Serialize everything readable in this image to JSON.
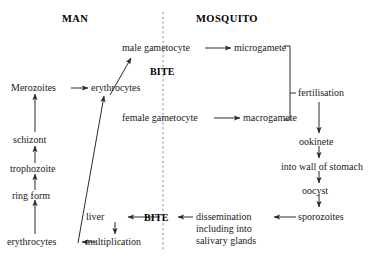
{
  "diagram": {
    "title_left": "MAN",
    "title_right": "MOSQUITO",
    "divider": "dashed-vertical-line",
    "bite_upper": "BITE",
    "bite_lower": "BITE",
    "colors": {
      "background": "#ffffff",
      "text": "#1a1a1a",
      "stroke": "#333333"
    },
    "nodes": {
      "merozoites": "Merozoites",
      "erythrocytes_upper": "erythrocytes",
      "schizont": "schizont",
      "trophozoite": "trophozoite",
      "ring_form": "ring form",
      "erythrocytes_lower": "erythrocytes",
      "multiplication": "multiplication",
      "liver": "liver",
      "male_gametocyte": "male gametocyte",
      "female_gametocyte": "female gametocyte",
      "microgamete": "microgamete",
      "macrogamete": "macrogamete",
      "fertilisation": "fertilisation",
      "ookinete": "ookinete",
      "into_wall_of_stomach": "into wall of stomach",
      "oocyst": "oocyst",
      "sporozoites": "sporozoites",
      "dissemination_line1": "dissemination",
      "dissemination_line2": "including into",
      "dissemination_line3": "salivary glands"
    }
  }
}
